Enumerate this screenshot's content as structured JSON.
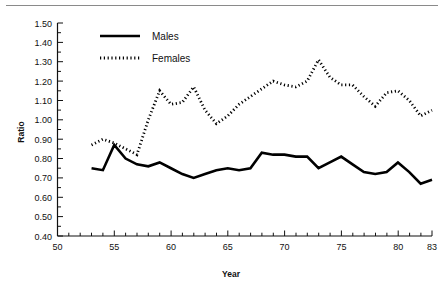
{
  "chart_data": {
    "type": "line",
    "title": "",
    "xlabel": "Year",
    "ylabel": "Ratio",
    "xlim": [
      50,
      83
    ],
    "ylim": [
      0.4,
      1.5
    ],
    "xticks": [
      50,
      55,
      60,
      65,
      70,
      75,
      80,
      83
    ],
    "xtick_labels": [
      "50",
      "55",
      "60",
      "65",
      "70",
      "75",
      "80",
      "83"
    ],
    "yticks": [
      0.4,
      0.5,
      0.6,
      0.7,
      0.8,
      0.9,
      1.0,
      1.1,
      1.2,
      1.3,
      1.4,
      1.5
    ],
    "ytick_labels": [
      "0.40",
      "0.50",
      "0.60",
      "0.70",
      "0.80",
      "0.90",
      "1.00",
      "1.10",
      "1.20",
      "1.30",
      "1.40",
      "1.50"
    ],
    "grid": false,
    "legend_position": "top-left-inside",
    "x": [
      53,
      54,
      55,
      56,
      57,
      58,
      59,
      60,
      61,
      62,
      63,
      64,
      65,
      66,
      67,
      68,
      69,
      70,
      71,
      72,
      73,
      74,
      75,
      76,
      77,
      78,
      79,
      80,
      81,
      82,
      83
    ],
    "series": [
      {
        "name": "Males",
        "style": "solid",
        "color": "#000000",
        "values": [
          0.75,
          0.74,
          0.87,
          0.8,
          0.77,
          0.76,
          0.78,
          0.75,
          0.72,
          0.7,
          0.72,
          0.74,
          0.75,
          0.74,
          0.75,
          0.83,
          0.82,
          0.82,
          0.81,
          0.81,
          0.75,
          0.78,
          0.81,
          0.77,
          0.73,
          0.72,
          0.73,
          0.78,
          0.73,
          0.67,
          0.69
        ]
      },
      {
        "name": "Females",
        "style": "dotted",
        "color": "#000000",
        "values": [
          0.87,
          0.9,
          0.88,
          0.85,
          0.82,
          1.0,
          1.15,
          1.08,
          1.09,
          1.17,
          1.05,
          0.98,
          1.02,
          1.08,
          1.12,
          1.16,
          1.2,
          1.18,
          1.17,
          1.2,
          1.31,
          1.22,
          1.18,
          1.18,
          1.12,
          1.07,
          1.14,
          1.15,
          1.1,
          1.02,
          1.05
        ]
      }
    ],
    "females_extra_note": ""
  },
  "legend": {
    "items": [
      {
        "label": "Males",
        "style": "solid"
      },
      {
        "label": "Females",
        "style": "dotted"
      }
    ]
  },
  "axes": {
    "x_title": "Year",
    "y_title": "Ratio"
  }
}
